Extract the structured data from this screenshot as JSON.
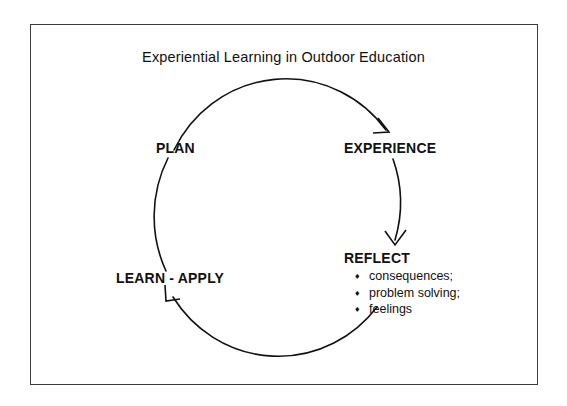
{
  "figure": {
    "title": "Experiential Learning in Outdoor Education",
    "border_color": "#3c3c3c",
    "background": "#ffffff",
    "stroke_color": "#111111"
  },
  "cycle": {
    "nodes": [
      {
        "id": "plan",
        "label": "PLAN"
      },
      {
        "id": "experience",
        "label": "EXPERIENCE"
      },
      {
        "id": "reflect",
        "label": "REFLECT"
      },
      {
        "id": "learn-apply",
        "label": "LEARN - APPLY"
      }
    ],
    "reflect_details": {
      "bullet_glyph": "♦",
      "items": [
        "consequences;",
        "problem solving;",
        "feelings"
      ]
    },
    "arrows": [
      {
        "id": "to-experience",
        "direction": "down-right"
      },
      {
        "id": "to-reflect",
        "direction": "down"
      },
      {
        "id": "to-learn-apply",
        "direction": "up-left"
      }
    ]
  }
}
